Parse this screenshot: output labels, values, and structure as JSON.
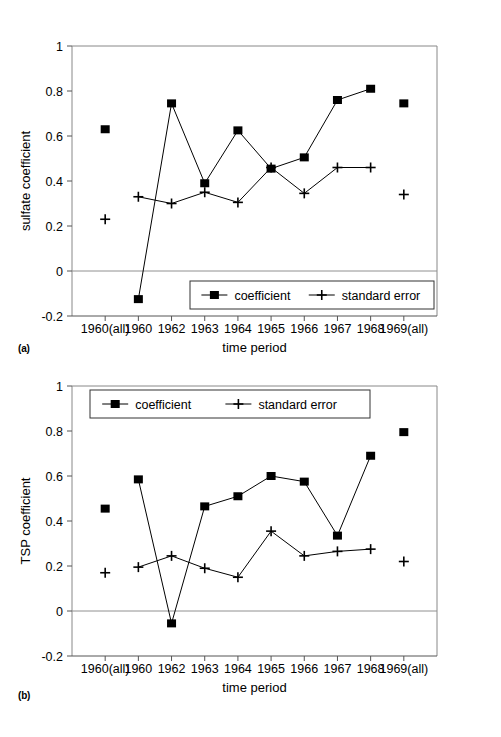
{
  "figure": {
    "panels": [
      {
        "tag": "(a)",
        "ylabel": "sulfate coefficient",
        "xlabel": "time period"
      },
      {
        "tag": "(b)",
        "ylabel": "TSP coefficient",
        "xlabel": "time period"
      }
    ],
    "legend": {
      "coefficient_label": "coefficient",
      "standard_error_label": "standard error"
    },
    "marker_colors": {
      "series": "#000000",
      "axis": "#808080",
      "zero_line": "#808080"
    }
  },
  "chart_data": [
    {
      "type": "line",
      "panel": "(a)",
      "title": "",
      "xlabel": "time period",
      "ylabel": "sulfate coefficient",
      "categories": [
        "1960(all)",
        "1960",
        "1962",
        "1963",
        "1964",
        "1965",
        "1966",
        "1967",
        "1968",
        "1969(all)"
      ],
      "xtick_labels": [
        "1960(all)",
        "1960",
        "1962",
        "1963",
        "1964",
        "1965",
        "1966",
        "1967",
        "1968",
        "1969(all)"
      ],
      "ytick_labels": [
        "1",
        "0.8",
        "0.6",
        "0.4",
        "0.2",
        "0",
        "-0.2"
      ],
      "ylim": [
        -0.2,
        1
      ],
      "yticks": [
        1,
        0.8,
        0.6,
        0.4,
        0.2,
        0,
        -0.2
      ],
      "grid": false,
      "legend_position": "bottom-center",
      "zero_line": 0,
      "series": [
        {
          "name": "coefficient",
          "marker": "square",
          "connected": [
            false,
            true,
            true,
            true,
            true,
            true,
            true,
            true,
            true,
            false
          ],
          "values": [
            0.63,
            -0.125,
            0.745,
            0.39,
            0.625,
            0.455,
            0.505,
            0.76,
            0.81,
            0.745
          ]
        },
        {
          "name": "standard error",
          "marker": "plus",
          "connected": [
            false,
            true,
            true,
            true,
            true,
            true,
            true,
            true,
            true,
            false
          ],
          "values": [
            0.23,
            0.33,
            0.3,
            0.35,
            0.305,
            0.46,
            0.345,
            0.46,
            0.46,
            0.34
          ]
        }
      ]
    },
    {
      "type": "line",
      "panel": "(b)",
      "title": "",
      "xlabel": "time period",
      "ylabel": "TSP coefficient",
      "categories": [
        "1960(all)",
        "1960",
        "1962",
        "1963",
        "1964",
        "1965",
        "1966",
        "1967",
        "1968",
        "1969(all)"
      ],
      "xtick_labels": [
        "1960(all)",
        "1960",
        "1962",
        "1963",
        "1964",
        "1965",
        "1966",
        "1967",
        "1968",
        "1969(all)"
      ],
      "ytick_labels": [
        "1",
        "0.8",
        "0.6",
        "0.4",
        "0.2",
        "0",
        "-0.2"
      ],
      "ylim": [
        -0.2,
        1
      ],
      "yticks": [
        1,
        0.8,
        0.6,
        0.4,
        0.2,
        0,
        -0.2
      ],
      "grid": false,
      "legend_position": "top-left",
      "zero_line": 0,
      "series": [
        {
          "name": "coefficient",
          "marker": "square",
          "connected": [
            false,
            true,
            true,
            true,
            true,
            true,
            true,
            true,
            true,
            false
          ],
          "values": [
            0.455,
            0.585,
            -0.055,
            0.465,
            0.51,
            0.6,
            0.575,
            0.335,
            0.69,
            0.795
          ]
        },
        {
          "name": "standard error",
          "marker": "plus",
          "connected": [
            false,
            true,
            true,
            true,
            true,
            true,
            true,
            true,
            true,
            false
          ],
          "values": [
            0.17,
            0.195,
            0.245,
            0.19,
            0.15,
            0.355,
            0.245,
            0.265,
            0.275,
            0.22
          ]
        }
      ]
    }
  ]
}
